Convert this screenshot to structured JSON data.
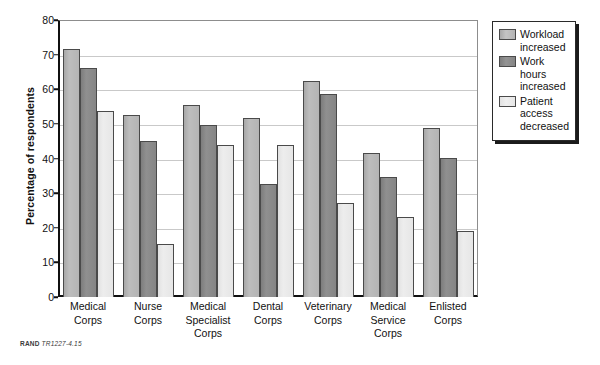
{
  "chart_data": {
    "type": "bar",
    "title": "",
    "xlabel": "",
    "ylabel": "Percentage of respondents",
    "ylim": [
      0,
      80
    ],
    "ytick_step": 10,
    "yticks": [
      "80",
      "70",
      "60",
      "50",
      "40",
      "30",
      "20",
      "10",
      "0"
    ],
    "grid": true,
    "legend_position": "right-outside",
    "categories": [
      "Medical Corps",
      "Nurse Corps",
      "Medical Specialist Corps",
      "Dental Corps",
      "Veterinary Corps",
      "Medical Service Corps",
      "Enlisted Corps"
    ],
    "category_label_lines": [
      [
        "Medical",
        "Corps"
      ],
      [
        "Nurse",
        "Corps"
      ],
      [
        "Medical",
        "Specialist",
        "Corps"
      ],
      [
        "Dental",
        "Corps"
      ],
      [
        "Veterinary",
        "Corps"
      ],
      [
        "Medical",
        "Service",
        "Corps"
      ],
      [
        "Enlisted",
        "Corps"
      ]
    ],
    "series": [
      {
        "name": "Workload increased",
        "label_lines": [
          "Workload",
          "increased"
        ],
        "color": "#b4b4b4",
        "values": [
          71.5,
          52.5,
          55.5,
          51.8,
          62.5,
          41.5,
          48.8
        ]
      },
      {
        "name": "Work hours increased",
        "label_lines": [
          "Work",
          "hours",
          "increased"
        ],
        "color": "#858585",
        "values": [
          66.0,
          45.0,
          49.8,
          32.5,
          58.5,
          34.8,
          40.2
        ]
      },
      {
        "name": "Patient access decreased",
        "label_lines": [
          "Patient",
          "access",
          "decreased"
        ],
        "color": "#e6e6e6",
        "values": [
          53.7,
          15.2,
          44.0,
          43.8,
          27.2,
          23.0,
          19.0
        ]
      }
    ]
  },
  "footnote": {
    "mark": "RAND",
    "id": "TR1227-4.15"
  }
}
